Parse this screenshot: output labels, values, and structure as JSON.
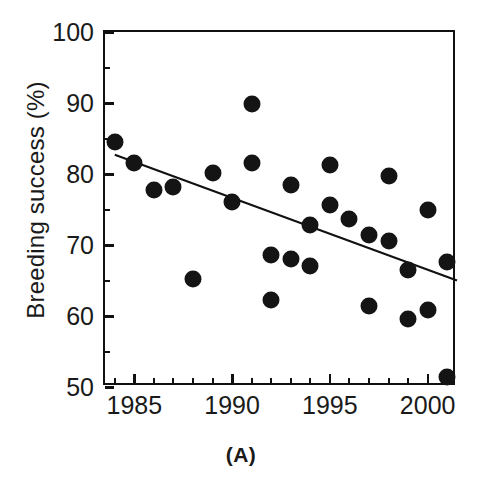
{
  "panel": {
    "label": "(A)"
  },
  "chart_data": {
    "type": "scatter",
    "title": "",
    "xlabel": "",
    "ylabel": "Breeding success (%)",
    "xlim": [
      1983.5,
      2001.5
    ],
    "ylim": [
      50,
      100
    ],
    "grid": false,
    "legend": "none",
    "x_ticks_major": [
      1985,
      1990,
      1995,
      2000
    ],
    "x_tick_labels": [
      "1985",
      "1990",
      "1995",
      "2000"
    ],
    "x_ticks_minor": [
      1984,
      1986,
      1987,
      1988,
      1989,
      1991,
      1992,
      1993,
      1994,
      1996,
      1997,
      1998,
      1999,
      2001
    ],
    "y_ticks_major": [
      50,
      60,
      70,
      80,
      90,
      100
    ],
    "y_tick_labels": [
      "50",
      "60",
      "70",
      "80",
      "90",
      "100"
    ],
    "y_ticks_minor": [
      55,
      65,
      75,
      85,
      95
    ],
    "points": [
      {
        "x": 1984,
        "y": 84.5
      },
      {
        "x": 1985,
        "y": 81.5
      },
      {
        "x": 1986,
        "y": 77.7
      },
      {
        "x": 1987,
        "y": 78.2
      },
      {
        "x": 1988,
        "y": 65.2
      },
      {
        "x": 1989,
        "y": 80.2
      },
      {
        "x": 1990,
        "y": 76.1
      },
      {
        "x": 1991,
        "y": 89.8
      },
      {
        "x": 1991,
        "y": 81.6
      },
      {
        "x": 1992,
        "y": 68.6
      },
      {
        "x": 1992,
        "y": 62.2
      },
      {
        "x": 1993,
        "y": 78.5
      },
      {
        "x": 1993,
        "y": 68.0
      },
      {
        "x": 1994,
        "y": 72.8
      },
      {
        "x": 1994,
        "y": 67.0
      },
      {
        "x": 1995,
        "y": 81.3
      },
      {
        "x": 1995,
        "y": 75.6
      },
      {
        "x": 1996,
        "y": 73.7
      },
      {
        "x": 1997,
        "y": 71.4
      },
      {
        "x": 1997,
        "y": 61.4
      },
      {
        "x": 1998,
        "y": 79.7
      },
      {
        "x": 1998,
        "y": 70.6
      },
      {
        "x": 1999,
        "y": 66.5
      },
      {
        "x": 1999,
        "y": 59.6
      },
      {
        "x": 2000,
        "y": 74.9
      },
      {
        "x": 2000,
        "y": 60.9
      },
      {
        "x": 2001,
        "y": 67.6
      },
      {
        "x": 2001,
        "y": 51.4
      }
    ],
    "trendline": {
      "x0": 1984.0,
      "y0": 82.7,
      "x1": 2001.5,
      "y1": 65.0
    },
    "colors": {
      "marker": "#141414",
      "axis": "#111111",
      "text": "#1a1a1a",
      "background": "#ffffff"
    }
  }
}
